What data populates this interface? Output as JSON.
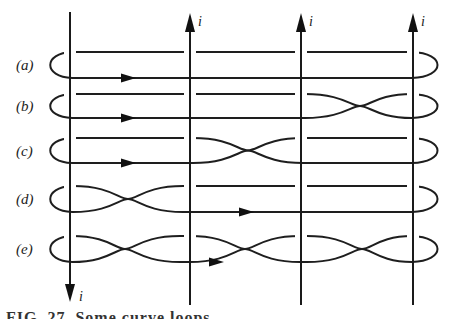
{
  "diagram": {
    "current_label": "i",
    "wires": [
      {
        "id": "wire-1",
        "x": 70,
        "direction": "down",
        "label": "i"
      },
      {
        "id": "wire-2",
        "x": 190,
        "direction": "up",
        "label": "i"
      },
      {
        "id": "wire-3",
        "x": 301,
        "direction": "up",
        "label": "i"
      },
      {
        "id": "wire-4",
        "x": 413,
        "direction": "up",
        "label": "i"
      }
    ],
    "loops": [
      {
        "label": "(a)",
        "top": 52,
        "bottom": 78,
        "crossings_x": [],
        "arrow_x": 130
      },
      {
        "label": "(b)",
        "top": 94,
        "bottom": 118,
        "crossings_x": [
          360
        ],
        "arrow_x": 130
      },
      {
        "label": "(c)",
        "top": 138,
        "bottom": 163,
        "crossings_x": [
          248
        ],
        "arrow_x": 130
      },
      {
        "label": "(d)",
        "top": 186,
        "bottom": 212,
        "crossings_x": [
          128
        ],
        "arrow_x": 248
      },
      {
        "label": "(e)",
        "top": 236,
        "bottom": 262,
        "crossings_x": [
          125,
          245,
          362
        ],
        "arrow_x": 218
      }
    ],
    "caption_partial": "FIG. 27. Some curve loops..."
  }
}
